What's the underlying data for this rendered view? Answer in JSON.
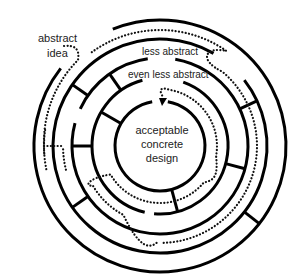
{
  "diagram": {
    "labels": {
      "start": [
        "abstract",
        "idea"
      ],
      "ring1": "less abstract",
      "ring2": "even less abstract",
      "center": [
        "acceptable",
        "concrete",
        "design"
      ]
    },
    "colors": {
      "wall": "#000000",
      "path": "#111111",
      "background": "#ffffff",
      "text": "#222222"
    },
    "icons": {
      "path_end": "arrowhead-icon"
    }
  }
}
